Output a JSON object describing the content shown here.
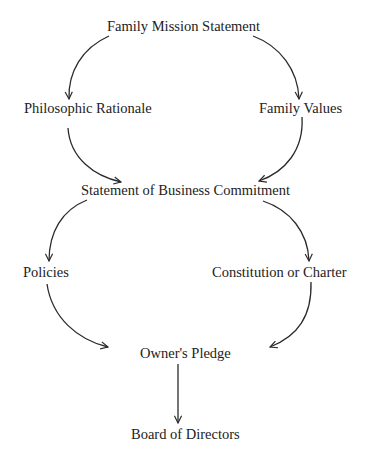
{
  "diagram": {
    "type": "flow",
    "nodes": [
      {
        "id": "mission",
        "label": "Family Mission Statement"
      },
      {
        "id": "rationale",
        "label": "Philosophic Rationale"
      },
      {
        "id": "values",
        "label": "Family Values"
      },
      {
        "id": "commitment",
        "label": "Statement of Business Commitment"
      },
      {
        "id": "policies",
        "label": "Policies"
      },
      {
        "id": "constitution",
        "label": "Constitution or Charter"
      },
      {
        "id": "pledge",
        "label": "Owner's Pledge"
      },
      {
        "id": "board",
        "label": "Board of Directors"
      }
    ],
    "edges": [
      {
        "from": "mission",
        "to": "rationale"
      },
      {
        "from": "mission",
        "to": "values"
      },
      {
        "from": "rationale",
        "to": "commitment"
      },
      {
        "from": "values",
        "to": "commitment"
      },
      {
        "from": "commitment",
        "to": "policies"
      },
      {
        "from": "commitment",
        "to": "constitution"
      },
      {
        "from": "policies",
        "to": "pledge"
      },
      {
        "from": "constitution",
        "to": "pledge"
      },
      {
        "from": "pledge",
        "to": "board"
      }
    ],
    "colors": {
      "line": "#2a2a2a",
      "text": "#222222",
      "background": "#ffffff"
    }
  }
}
